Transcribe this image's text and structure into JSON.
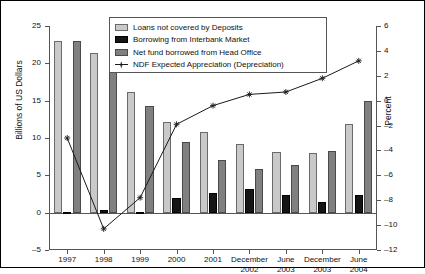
{
  "chart_data": {
    "type": "bar",
    "title": "",
    "categories": [
      "1997",
      "1998",
      "1999",
      "2000",
      "2001",
      "December 2002",
      "June 2003",
      "December 2003",
      "June 2004"
    ],
    "category_lines": [
      [
        "1997"
      ],
      [
        "1998"
      ],
      [
        "1999"
      ],
      [
        "2000"
      ],
      [
        "2001"
      ],
      [
        "December",
        "2002"
      ],
      [
        "June",
        "2003"
      ],
      [
        "December",
        "2003"
      ],
      [
        "June",
        "2004"
      ]
    ],
    "xlabel": "",
    "ylabel": "Billions of US Dollars",
    "ylim": [
      -5,
      25
    ],
    "yticks": [
      -5,
      0,
      5,
      10,
      15,
      20,
      25
    ],
    "y2label": "Percent",
    "y2lim": [
      -12,
      6
    ],
    "y2ticks": [
      -12,
      -10,
      -8,
      -6,
      -4,
      -2,
      0,
      2,
      4,
      6
    ],
    "grid": false,
    "legend_position": "top-center",
    "series": [
      {
        "name": "Loans not covered by Deposits",
        "type": "bar",
        "axis": "left",
        "color": "#c9c9c9",
        "values": [
          23.0,
          21.4,
          16.2,
          12.1,
          10.8,
          9.2,
          8.1,
          8.0,
          11.9
        ]
      },
      {
        "name": "Borrowing from Interbank Market",
        "type": "bar",
        "axis": "left",
        "color": "#151515",
        "values": [
          0.1,
          0.3,
          0.1,
          1.9,
          2.7,
          3.2,
          2.4,
          1.4,
          2.4
        ]
      },
      {
        "name": "Net fund borrowed from Head Office",
        "type": "bar",
        "axis": "left",
        "color": "#808080",
        "values": [
          23.0,
          19.4,
          14.3,
          9.5,
          7.1,
          5.9,
          6.4,
          8.2,
          15.0
        ]
      },
      {
        "name": "NDF Expected Appreciation (Depreciation)",
        "type": "line",
        "axis": "right",
        "color": "#1a1a1a",
        "values": [
          -3.0,
          -10.3,
          -7.8,
          -1.9,
          -0.4,
          0.5,
          0.7,
          1.8,
          3.2
        ]
      }
    ]
  },
  "legend": {
    "items": [
      {
        "label": "Loans not covered by Deposits",
        "marker": "swatch-light-gray"
      },
      {
        "label": "Borrowing from Interbank Market",
        "marker": "swatch-black"
      },
      {
        "label": "Net fund borrowed from Head Office",
        "marker": "swatch-dark-gray"
      },
      {
        "label": "NDF Expected Appreciation (Depreciation)",
        "marker": "line-with-star-marker"
      }
    ]
  }
}
